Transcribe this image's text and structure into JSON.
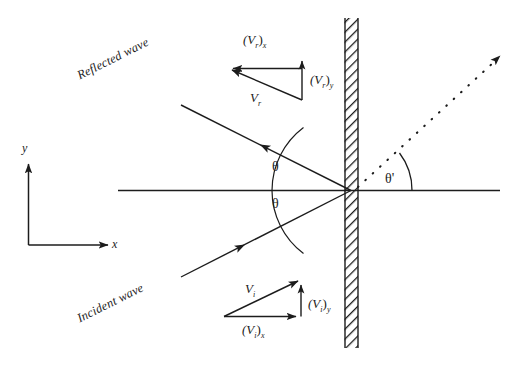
{
  "figure": {
    "background_color": "#ffffff",
    "stroke_color": "#1c1c1c"
  },
  "axes": {
    "y_label": "y",
    "x_label": "x"
  },
  "angles": {
    "theta_incident": "θ",
    "theta_reflected": "θ",
    "theta_transmitted": "θ'"
  },
  "rays": {
    "reflected_wave_label": "Reflected wave",
    "incident_wave_label": "Incident wave"
  },
  "reflected_triangle": {
    "resultant": "V",
    "resultant_sub": "r",
    "x_component_open": "(V",
    "x_component_sub": "r",
    "x_component_close": ")",
    "x_component_axis": "x",
    "y_component_open": "(V",
    "y_component_sub": "r",
    "y_component_close": ")",
    "y_component_axis": "y"
  },
  "incident_triangle": {
    "resultant": "V",
    "resultant_sub": "i",
    "x_component_open": "(V",
    "x_component_sub": "i",
    "x_component_close": ")",
    "x_component_axis": "x",
    "y_component_open": "(V",
    "y_component_sub": "i",
    "y_component_close": ")",
    "y_component_axis": "y"
  },
  "boundary": {
    "name": "rigid-wall",
    "hatch_style": "diagonal"
  }
}
